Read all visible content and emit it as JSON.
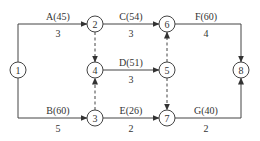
{
  "diagram": {
    "type": "activity-on-arrow network",
    "nodes": [
      {
        "id": "1",
        "label": "1",
        "x": 18,
        "y": 70
      },
      {
        "id": "2",
        "label": "2",
        "x": 95,
        "y": 24
      },
      {
        "id": "3",
        "label": "3",
        "x": 95,
        "y": 118
      },
      {
        "id": "4",
        "label": "4",
        "x": 95,
        "y": 70
      },
      {
        "id": "5",
        "label": "5",
        "x": 167,
        "y": 70
      },
      {
        "id": "6",
        "label": "6",
        "x": 167,
        "y": 24
      },
      {
        "id": "7",
        "label": "7",
        "x": 167,
        "y": 118
      },
      {
        "id": "8",
        "label": "8",
        "x": 241,
        "y": 70
      }
    ],
    "activities": [
      {
        "name": "A(45)",
        "duration": "3",
        "from": "1",
        "to": "2"
      },
      {
        "name": "B(60)",
        "duration": "5",
        "from": "1",
        "to": "3"
      },
      {
        "name": "C(54)",
        "duration": "3",
        "from": "2",
        "to": "6"
      },
      {
        "name": "D(51)",
        "duration": "3",
        "from": "4",
        "to": "5"
      },
      {
        "name": "E(26)",
        "duration": "2",
        "from": "3",
        "to": "7"
      },
      {
        "name": "F(60)",
        "duration": "4",
        "from": "6",
        "to": "8"
      },
      {
        "name": "G(40)",
        "duration": "2",
        "from": "7",
        "to": "8"
      }
    ],
    "dummies": [
      {
        "from": "2",
        "to": "4"
      },
      {
        "from": "3",
        "to": "4"
      },
      {
        "from": "5",
        "to": "6"
      },
      {
        "from": "5",
        "to": "7"
      }
    ]
  }
}
